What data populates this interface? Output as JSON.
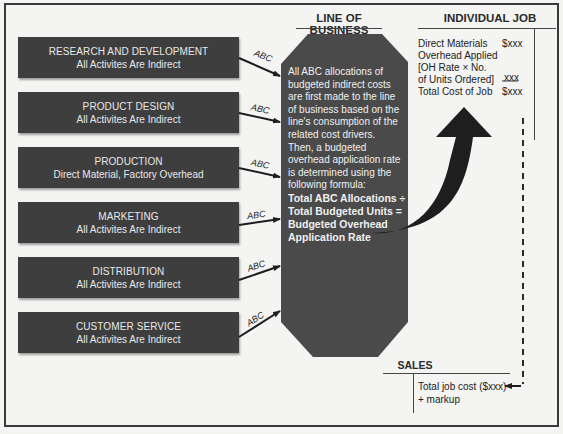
{
  "headers": {
    "line_of_business": "LINE OF BUSINESS",
    "individual_job": "INDIVIDUAL JOB",
    "sales": "SALES"
  },
  "departments": [
    {
      "title": "RESEARCH AND DEVELOPMENT",
      "subtitle": "All Activites Are Indirect"
    },
    {
      "title": "PRODUCT DESIGN",
      "subtitle": "All Activites Are Indirect"
    },
    {
      "title": "PRODUCTION",
      "subtitle": "Direct Material, Factory Overhead"
    },
    {
      "title": "MARKETING",
      "subtitle": "All Activites Are Indirect"
    },
    {
      "title": "DISTRIBUTION",
      "subtitle": "All Activites Are Indirect"
    },
    {
      "title": "CUSTOMER SERVICE",
      "subtitle": "All Activites Are Indirect"
    }
  ],
  "arrow_label": "ABC",
  "line_of_business_text": {
    "lines": [
      "All ABC allocations of",
      "budgeted indirect costs",
      "are first made to the line",
      "of business based on the",
      "line's consumption of the",
      "related cost drivers.",
      "Then, a budgeted",
      "overhead application rate",
      "is determined using the",
      "following formula:"
    ],
    "formula": [
      "Total ABC Allocations ÷",
      "Total Budgeted Units =",
      "Budgeted Overhead",
      "Application Rate"
    ]
  },
  "individual_job": {
    "lines": [
      "Direct Materials",
      "Overhead Applied",
      "[OH Rate × No.",
      "of Units Ordered]",
      "Total Cost of Job"
    ],
    "amounts": {
      "direct_materials": "$xxx",
      "overhead_applied": "xxx",
      "total": "$xxx"
    }
  },
  "sales": {
    "lines": [
      "Total job cost ($xxx)",
      "+ markup"
    ]
  },
  "colors": {
    "box_fill": "#3e3e3e",
    "octagon_fill": "#4a4a4a",
    "background": "#f4f4f2",
    "arrow": "#1e1e1e"
  }
}
